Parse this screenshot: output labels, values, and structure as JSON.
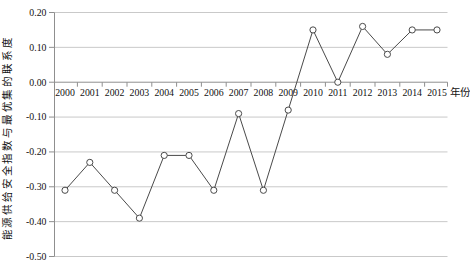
{
  "chart_data": {
    "type": "line",
    "title": "",
    "ylabel": "能源供给安全指数与最优集的联系度",
    "xlabel": "年份",
    "categories": [
      "2000",
      "2001",
      "2002",
      "2003",
      "2004",
      "2005",
      "2006",
      "2007",
      "2008",
      "2009",
      "2010",
      "2011",
      "2012",
      "2013",
      "2014",
      "2015"
    ],
    "values": [
      -0.31,
      -0.23,
      -0.31,
      -0.39,
      -0.21,
      -0.21,
      -0.31,
      -0.09,
      -0.31,
      -0.08,
      0.15,
      0.0,
      0.16,
      0.08,
      0.15,
      0.15
    ],
    "ylim": [
      -0.5,
      0.2
    ],
    "ytick_labels": [
      "0.20",
      "0.10",
      "0.00",
      "-0.10",
      "-0.20",
      "-0.30",
      "-0.40",
      "-0.50"
    ],
    "grid": "horizontal",
    "legend": "none",
    "marker": "open-circle",
    "colors": {
      "line": "#4a4a4a",
      "marker_fill": "#ffffff",
      "grid": "#c9c9c9",
      "axis": "#8f8f8f",
      "text": "#111111",
      "background": "#ffffff"
    }
  }
}
